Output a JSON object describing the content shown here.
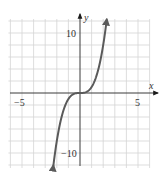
{
  "chart_data": {
    "type": "line",
    "title": "",
    "xlabel": "x",
    "ylabel": "y",
    "xlim": [
      -6,
      6
    ],
    "ylim": [
      -12,
      12
    ],
    "x_ticks_labeled": [
      -5,
      5
    ],
    "y_ticks_labeled": [
      10,
      -10
    ],
    "x_tick_labels": [
      "−5",
      "5"
    ],
    "y_tick_labels": [
      "10",
      "−10"
    ],
    "grid": true,
    "grid_x_step": 1,
    "grid_y_step": 2,
    "function": "y = x^3",
    "series": [
      {
        "name": "y = x^3",
        "color": "#5a5a5a",
        "arrows_at_ends": true,
        "x": [
          -2.3,
          -2.0,
          -1.5,
          -1.0,
          -0.5,
          0,
          0.5,
          1.0,
          1.5,
          2.0,
          2.3
        ],
        "y": [
          -12.2,
          -8,
          -3.375,
          -1,
          -0.125,
          0,
          0.125,
          1,
          3.375,
          8,
          12.2
        ]
      }
    ]
  },
  "axes": {
    "x_name": "x",
    "y_name": "y",
    "x_neg_label": "−5",
    "x_pos_label": "5",
    "y_pos_label": "10",
    "y_neg_label": "−10"
  },
  "colors": {
    "grid": "#d4d4d4",
    "axis": "#3a3a3a",
    "curve": "#5a5a5a"
  }
}
